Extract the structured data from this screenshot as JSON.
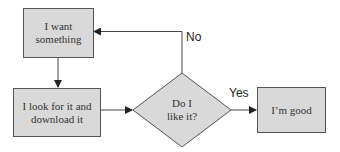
{
  "diagram": {
    "type": "flowchart",
    "nodes": [
      {
        "id": "want",
        "shape": "rectangle",
        "label": "I want something"
      },
      {
        "id": "look",
        "shape": "rectangle",
        "label": "I look for it and download it"
      },
      {
        "id": "like",
        "shape": "diamond",
        "label": "Do I like it?"
      },
      {
        "id": "good",
        "shape": "rectangle",
        "label": "I'm good"
      }
    ],
    "edges": [
      {
        "from": "want",
        "to": "look",
        "label": ""
      },
      {
        "from": "look",
        "to": "like",
        "label": ""
      },
      {
        "from": "like",
        "to": "good",
        "label": "Yes"
      },
      {
        "from": "like",
        "to": "want",
        "label": "No"
      }
    ]
  },
  "labels": {
    "want_line1": "I want",
    "want_line2": "something",
    "look_line1": "I look for it and",
    "look_line2": "download it",
    "like_line1": "Do I",
    "like_line2": "like it?",
    "good": "I’m good",
    "yes": "Yes",
    "no": "No"
  },
  "colors": {
    "fill": "#d9d9d9",
    "stroke": "#555555",
    "line": "#444444"
  }
}
